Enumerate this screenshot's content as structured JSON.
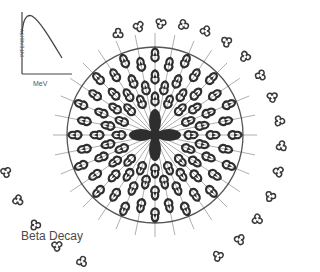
{
  "diagram": {
    "title": "Beta Decay",
    "inset_plot": {
      "xlabel": "MeV",
      "ylabel": "INTENSITY",
      "curve": "rises sharply then decays linearly"
    },
    "colors": {
      "background": "#ffffff",
      "stroke": "#3a3a3a",
      "dark_fill": "#2e2e2e",
      "ray": "#9a9a9a",
      "circle": "#555555",
      "text": "#4a4a4a"
    },
    "nucleus": {
      "cx": 155,
      "cy": 135,
      "r": 88
    },
    "ray_count": 32,
    "inner_trefoils_per_ray": [
      3,
      2
    ],
    "outer_trefoils": "spiral ring of particles outside the circle"
  }
}
